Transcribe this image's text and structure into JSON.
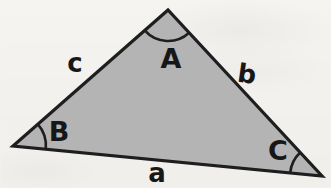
{
  "figure": {
    "type": "geometry-diagram",
    "colors": {
      "background": "#f4f2ef",
      "triangle_fill": "#b4b4b4",
      "line": "#1e1e1e",
      "label": "#171717"
    },
    "triangle": {
      "points": "168,10 13,146 322,176"
    },
    "angle_arcs": {
      "A": "M 144.7 30.4 A 31 31 0 0 0 189.1 32.7",
      "B": "M 37.8 124.2 A 33 33 0 0 1 45.8 149.2",
      "C": "M 300.2 152.5 A 32 32 0 0 0 290.2 172.9"
    },
    "vertex_labels": [
      {
        "text": "A",
        "x": 171,
        "y": 58
      },
      {
        "text": "B",
        "x": 59,
        "y": 131
      },
      {
        "text": "C",
        "x": 278,
        "y": 150
      }
    ],
    "side_labels": [
      {
        "text": "c",
        "x": 75,
        "y": 63
      },
      {
        "text": "b",
        "x": 247,
        "y": 74
      },
      {
        "text": "a",
        "x": 157,
        "y": 173
      }
    ]
  }
}
